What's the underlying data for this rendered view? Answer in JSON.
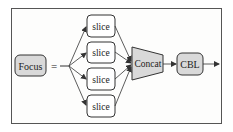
{
  "diagram": {
    "nodes": {
      "focus": {
        "label": "Focus",
        "fill": "#d9d9d9"
      },
      "equals": {
        "label": "="
      },
      "slices": [
        {
          "label": "slice"
        },
        {
          "label": "slice"
        },
        {
          "label": "slice"
        },
        {
          "label": "slice"
        }
      ],
      "concat": {
        "label": "Concat",
        "fill": "#d9d9d9"
      },
      "cbl": {
        "label": "CBL",
        "fill": "#d9d9d9"
      }
    },
    "edges": [
      {
        "from": "split",
        "to": "slice-1"
      },
      {
        "from": "split",
        "to": "slice-2"
      },
      {
        "from": "split",
        "to": "slice-3"
      },
      {
        "from": "split",
        "to": "slice-4"
      },
      {
        "from": "slice-1",
        "to": "concat"
      },
      {
        "from": "slice-2",
        "to": "concat"
      },
      {
        "from": "slice-3",
        "to": "concat"
      },
      {
        "from": "slice-4",
        "to": "concat"
      },
      {
        "from": "concat",
        "to": "cbl"
      },
      {
        "from": "cbl",
        "to": "output"
      }
    ],
    "colors": {
      "stroke": "#333333",
      "node_fill_gray": "#d9d9d9",
      "node_fill_white": "#ffffff",
      "frame": "#555555"
    }
  }
}
